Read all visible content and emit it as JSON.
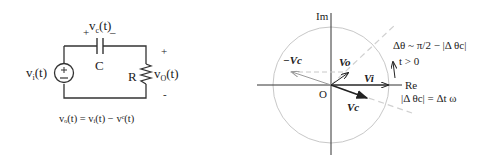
{
  "circuit": {
    "source_label": "v",
    "source_sub": "i",
    "source_suffix": "(t)",
    "source_plus": "+",
    "source_minus": "−",
    "cap_plus": "+",
    "cap_minus": "–",
    "cap_voltage": "v",
    "cap_voltage_sub": "c",
    "cap_voltage_suffix": "(t)",
    "cap_label": "C",
    "res_label": "R",
    "out_voltage": "v",
    "out_voltage_sub": "O",
    "out_voltage_suffix": "(t)",
    "out_plus": "+",
    "out_minus": "-",
    "equation": "vₒ(t) = vᵢ(t) − vᶜ(t)"
  },
  "phasor": {
    "im_label": "Im",
    "re_label": "Re",
    "origin_label": "O",
    "neg_vc_label": "−Vc",
    "vo_label": "Vo",
    "vi_label": "Vi",
    "vc_label": "Vc",
    "delta_theta_eq": "Δθ ~ π/2 − |Δ θc|",
    "t_condition": "t > 0",
    "delta_theta_c_eq": "|Δ θc| = Δt ω",
    "colors": {
      "circle": "#c8c8c8",
      "axis": "#333333",
      "vector": "#222222",
      "dashed": "#c8c8c8"
    }
  }
}
